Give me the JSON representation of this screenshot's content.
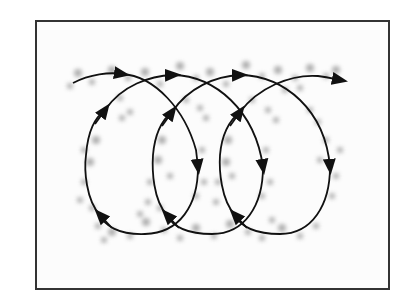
{
  "figure": {
    "colors": {
      "frame": "#333333",
      "background": "#fcfcfc",
      "path": "#111111",
      "dots": "#9a9a9a"
    },
    "loops": 3,
    "arrows": {
      "top_forward": 4,
      "down": 3,
      "up_left": 3,
      "up_right": 3
    }
  }
}
